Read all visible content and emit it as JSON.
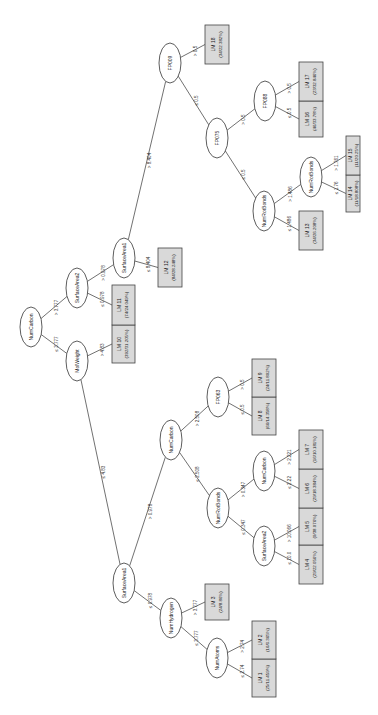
{
  "diagram": {
    "type": "M5P model tree",
    "orientation": "rotated 90 degrees clockwise",
    "colors": {
      "leaf_fill": "#d9d9d9",
      "node_fill": "#ffffff",
      "line": "#333333"
    },
    "nodes": [
      {
        "id": "n_root",
        "label": "NumCarbon",
        "cx": 31,
        "cy": 327
      },
      {
        "id": "n_sa2_top",
        "label": "SurfaceArea2",
        "cx": 77,
        "cy": 288
      },
      {
        "id": "n_molweight",
        "label": "MolWeight",
        "cx": 77,
        "cy": 361
      },
      {
        "id": "n_sa1_top",
        "label": "SurfaceArea1",
        "cx": 124,
        "cy": 258
      },
      {
        "id": "n_fp009",
        "label": "FP009",
        "cx": 170,
        "cy": 63
      },
      {
        "id": "n_fp075",
        "label": "FP075",
        "cx": 217,
        "cy": 138
      },
      {
        "id": "n_fp088",
        "label": "FP088",
        "cx": 265,
        "cy": 101
      },
      {
        "id": "n_nrb_top",
        "label": "NumRotBonds",
        "cx": 264,
        "cy": 211
      },
      {
        "id": "n_nrb_top2",
        "label": "NumRotBonds",
        "cx": 311,
        "cy": 177
      },
      {
        "id": "n_sa1_low",
        "label": "SurfaceArea1",
        "cx": 124,
        "cy": 583
      },
      {
        "id": "n_numcarbon_mid",
        "label": "NumCarbon",
        "cx": 171,
        "cy": 440
      },
      {
        "id": "n_fp063",
        "label": "FP063",
        "cx": 218,
        "cy": 397
      },
      {
        "id": "n_nrb_mid",
        "label": "NumRotBonds",
        "cx": 218,
        "cy": 508
      },
      {
        "id": "n_numcarbon_low",
        "label": "NumCarbon",
        "cx": 264,
        "cy": 471
      },
      {
        "id": "n_sa2_low",
        "label": "SurfaceArea2",
        "cx": 264,
        "cy": 546
      },
      {
        "id": "n_numhydrogen",
        "label": "NumHydrogen",
        "cx": 171,
        "cy": 618
      },
      {
        "id": "n_numatoms",
        "label": "NumAtoms",
        "cx": 217,
        "cy": 658
      }
    ],
    "leaves": [
      {
        "id": "lm1",
        "name": "LM 1",
        "stats": "(25/11.459%)",
        "x": 252,
        "y": 659,
        "w": 24,
        "h": 38
      },
      {
        "id": "lm2",
        "name": "LM 2",
        "stats": "(16/6.365%)",
        "x": 252,
        "y": 621,
        "w": 24,
        "h": 38
      },
      {
        "id": "lm3",
        "name": "LM 3",
        "stats": "(24/8.86%)",
        "x": 205,
        "y": 584,
        "w": 24,
        "h": 36
      },
      {
        "id": "lm4",
        "name": "LM 4",
        "stats": "(29/22.056%)",
        "x": 299,
        "y": 545,
        "w": 24,
        "h": 39
      },
      {
        "id": "lm5",
        "name": "LM 5",
        "stats": "(9/38.076%)",
        "x": 299,
        "y": 508,
        "w": 24,
        "h": 37
      },
      {
        "id": "lm6",
        "name": "LM 6",
        "stats": "(29/18.384%)",
        "x": 299,
        "y": 469,
        "w": 24,
        "h": 39
      },
      {
        "id": "lm7",
        "name": "LM 7",
        "stats": "(16/10.181%)",
        "x": 299,
        "y": 430,
        "w": 24,
        "h": 39
      },
      {
        "id": "lm8",
        "name": "LM 8",
        "stats": "(66/14.358%)",
        "x": 252,
        "y": 397,
        "w": 24,
        "h": 38
      },
      {
        "id": "lm9",
        "name": "LM 9",
        "stats": "(24/11.802%)",
        "x": 252,
        "y": 359,
        "w": 24,
        "h": 38
      },
      {
        "id": "lm10",
        "name": "LM 10",
        "stats": "(392/31.205%)",
        "x": 112,
        "y": 325,
        "w": 23,
        "h": 38
      },
      {
        "id": "lm11",
        "name": "LM 11",
        "stats": "(74/24.049%)",
        "x": 112,
        "y": 285,
        "w": 23,
        "h": 40
      },
      {
        "id": "lm12",
        "name": "LM 12",
        "stats": "(84/28.248%)",
        "x": 158,
        "y": 248,
        "w": 24,
        "h": 39
      },
      {
        "id": "lm13",
        "name": "LM 13",
        "stats": "(34/26.208%)",
        "x": 299,
        "y": 211,
        "w": 24,
        "h": 39
      },
      {
        "id": "lm14",
        "name": "LM 14",
        "stats": "(11/18.808%)",
        "x": 346,
        "y": 175,
        "w": 14,
        "h": 37
      },
      {
        "id": "lm15",
        "name": "LM 15",
        "stats": "(11/20.25%)",
        "x": 346,
        "y": 136,
        "w": 14,
        "h": 39
      },
      {
        "id": "lm16",
        "name": "LM 16",
        "stats": "(46/33.78%)",
        "x": 299,
        "y": 101,
        "w": 24,
        "h": 36
      },
      {
        "id": "lm17",
        "name": "LM 17",
        "stats": "(23/32.846%)",
        "x": 299,
        "y": 62,
        "w": 24,
        "h": 39
      },
      {
        "id": "lm18",
        "name": "LM 18",
        "stats": "(34/22.382%)",
        "x": 205,
        "y": 25,
        "w": 24,
        "h": 39
      }
    ],
    "edges": [
      {
        "from": "n_root",
        "to": "n_sa2_top",
        "label": "> 3.777"
      },
      {
        "from": "n_root",
        "to": "n_molweight",
        "label": "≤ 3.777"
      },
      {
        "from": "n_sa2_top",
        "to": "n_sa1_top",
        "label": "> 0.978"
      },
      {
        "from": "n_sa2_top",
        "to": "lm11",
        "label": "≤ 0.978"
      },
      {
        "from": "n_molweight",
        "to": "lm10",
        "label": "> 4.83"
      },
      {
        "from": "n_molweight",
        "to": "n_sa1_low",
        "label": "≤ 4.83"
      },
      {
        "from": "n_sa1_top",
        "to": "n_fp009",
        "label": "> 8.404"
      },
      {
        "from": "n_sa1_top",
        "to": "lm12",
        "label": "≤ 8.404"
      },
      {
        "from": "n_fp009",
        "to": "lm18",
        "label": "> 0.5"
      },
      {
        "from": "n_fp009",
        "to": "n_fp075",
        "label": "≤ 0.5"
      },
      {
        "from": "n_fp075",
        "to": "n_fp088",
        "label": "> 0.5"
      },
      {
        "from": "n_fp075",
        "to": "n_nrb_top",
        "label": "≤ 0.5"
      },
      {
        "from": "n_fp088",
        "to": "lm17",
        "label": "> 0.5"
      },
      {
        "from": "n_fp088",
        "to": "lm16",
        "label": "≤ 0.5"
      },
      {
        "from": "n_nrb_top",
        "to": "n_nrb_top2",
        "label": "> 1.486"
      },
      {
        "from": "n_nrb_top",
        "to": "lm13",
        "label": "≤ 1.486"
      },
      {
        "from": "n_nrb_top2",
        "to": "lm15",
        "label": "> 1.761"
      },
      {
        "from": "n_nrb_top2",
        "to": "lm14",
        "label": "≤ 1.76"
      },
      {
        "from": "n_sa1_low",
        "to": "n_numcarbon_mid",
        "label": "> 0.978"
      },
      {
        "from": "n_sa1_low",
        "to": "n_numhydrogen",
        "label": "≤ 0.978"
      },
      {
        "from": "n_numcarbon_mid",
        "to": "n_fp063",
        "label": "> 2.508"
      },
      {
        "from": "n_numcarbon_mid",
        "to": "n_nrb_mid",
        "label": "≤ 2.508"
      },
      {
        "from": "n_fp063",
        "to": "lm9",
        "label": "> 0.5"
      },
      {
        "from": "n_fp063",
        "to": "lm8",
        "label": "≤ 0.5"
      },
      {
        "from": "n_nrb_mid",
        "to": "n_numcarbon_low",
        "label": "> 0.347"
      },
      {
        "from": "n_nrb_mid",
        "to": "n_sa2_low",
        "label": "≤ 0.347"
      },
      {
        "from": "n_numcarbon_low",
        "to": "lm7",
        "label": "> 2.221"
      },
      {
        "from": "n_numcarbon_low",
        "to": "lm6",
        "label": "≤ 2.22"
      },
      {
        "from": "n_sa2_low",
        "to": "lm5",
        "label": "> 10.066"
      },
      {
        "from": "n_sa2_low",
        "to": "lm4",
        "label": "≤ 10.0"
      },
      {
        "from": "n_numhydrogen",
        "to": "lm3",
        "label": "> 3.777"
      },
      {
        "from": "n_numhydrogen",
        "to": "n_numatoms",
        "label": "≤ 3.777"
      },
      {
        "from": "n_numatoms",
        "to": "lm2",
        "label": "> 2.74"
      },
      {
        "from": "n_numatoms",
        "to": "lm1",
        "label": "≤ 2.74"
      }
    ]
  }
}
